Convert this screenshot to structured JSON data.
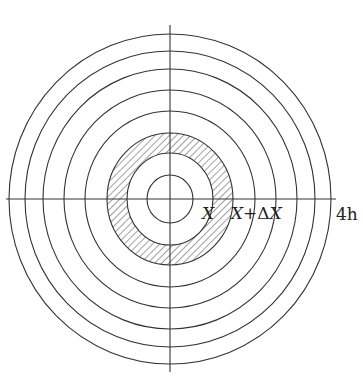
{
  "diagram": {
    "center": {
      "x": 170,
      "y": 199
    },
    "rings": [
      {
        "rx": 23,
        "ry": 24
      },
      {
        "rx": 43,
        "ry": 46,
        "hatch_inner": true
      },
      {
        "rx": 63,
        "ry": 66,
        "hatch_outer": true
      },
      {
        "rx": 85,
        "ry": 88
      },
      {
        "rx": 106,
        "ry": 109
      },
      {
        "rx": 127,
        "ry": 130
      },
      {
        "rx": 145,
        "ry": 148
      },
      {
        "rx": 161,
        "ry": 165
      }
    ],
    "hatched_annulus": {
      "inner_label": "X",
      "outer_label": "X+ΔX"
    },
    "labels": {
      "x_label": "X",
      "x_plus_dx_label": "X+ΔX",
      "x_plus": "X+",
      "delta": "Δ",
      "x2": "X",
      "outer_label": "4h"
    },
    "colors": {
      "stroke": "#333333",
      "hatch": "#444444",
      "background": "#ffffff"
    }
  }
}
